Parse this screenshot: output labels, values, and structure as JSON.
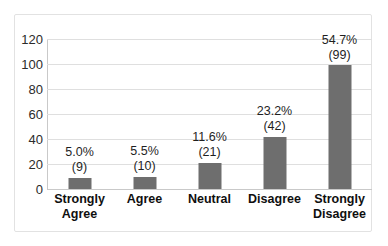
{
  "chart_data": {
    "type": "bar",
    "title": "",
    "xlabel": "",
    "ylabel": "",
    "ylim": [
      0,
      120
    ],
    "yticks": [
      0,
      20,
      40,
      60,
      80,
      100,
      120
    ],
    "grid": true,
    "legend": "none",
    "bar_color": "#6e6e6e",
    "gridline_color": "#dfdfdf",
    "categories": [
      "Strongly Agree",
      "Agree",
      "Neutral",
      "Disagree",
      "Strongly Disagree"
    ],
    "values": [
      9,
      10,
      21,
      42,
      99
    ],
    "percent_labels": [
      "5.0%",
      "5.5%",
      "11.6%",
      "23.2%",
      "54.7%"
    ],
    "count_labels": [
      "(9)",
      "(10)",
      "(21)",
      "(42)",
      "(99)"
    ]
  },
  "axis": {
    "y_tick_labels": [
      "120",
      "100",
      "80",
      "60",
      "40",
      "20",
      "0"
    ]
  },
  "categories": [
    {
      "line1": "Strongly",
      "line2": "Agree"
    },
    {
      "line1": "Agree",
      "line2": ""
    },
    {
      "line1": "Neutral",
      "line2": ""
    },
    {
      "line1": "Disagree",
      "line2": ""
    },
    {
      "line1": "Strongly",
      "line2": "Disagree"
    }
  ]
}
